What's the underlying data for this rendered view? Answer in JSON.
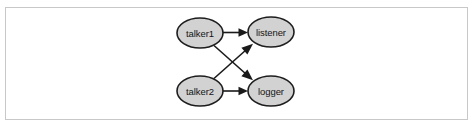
{
  "figure": {
    "background_color": "#ffffff",
    "frame_border_color": "#c8c8c8",
    "node_fill_color": "#d2d2d2",
    "node_stroke_color": "#1d1d1d",
    "edge_color": "#1a1a1a",
    "label_color": "#141414"
  },
  "graph": {
    "type": "directed-node-graph",
    "nodes": [
      {
        "id": "talker1",
        "label": "talker1",
        "cx": 200,
        "cy": 33,
        "rx": 23,
        "ry": 15
      },
      {
        "id": "listener",
        "label": "listener",
        "cx": 271,
        "cy": 32,
        "rx": 23,
        "ry": 15
      },
      {
        "id": "talker2",
        "label": "talker2",
        "cx": 200,
        "cy": 91,
        "rx": 23,
        "ry": 15
      },
      {
        "id": "logger",
        "label": "logger",
        "cx": 271,
        "cy": 91,
        "rx": 23,
        "ry": 15
      }
    ],
    "edges": [
      {
        "from": "talker1",
        "to": "listener",
        "style": "horizontal"
      },
      {
        "from": "talker2",
        "to": "logger",
        "style": "horizontal"
      },
      {
        "from": "talker1",
        "to": "logger",
        "style": "diagonal-down"
      },
      {
        "from": "talker2",
        "to": "listener",
        "style": "diagonal-up"
      }
    ]
  }
}
